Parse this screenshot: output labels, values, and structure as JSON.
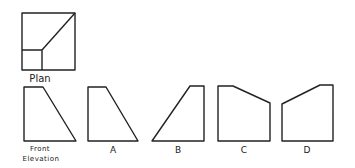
{
  "diagram": {
    "plan": {
      "label": "Plan"
    },
    "front_elevation": {
      "label_line1": "Front",
      "label_line2": "Elevation"
    },
    "options": [
      {
        "label": "A"
      },
      {
        "label": "B"
      },
      {
        "label": "C"
      },
      {
        "label": "D"
      }
    ],
    "stroke_color": "#222222",
    "background": "#ffffff"
  }
}
